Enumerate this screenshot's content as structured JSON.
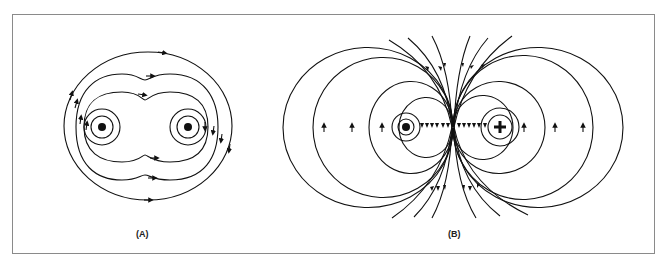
{
  "figure": {
    "panels": [
      {
        "id": "A",
        "label": "(A)",
        "description": "Magnetic field of two parallel conductors with current in the same direction (both out of page)",
        "conductors": [
          "dot",
          "dot"
        ]
      },
      {
        "id": "B",
        "label": "(B)",
        "description": "Magnetic field of two parallel conductors with current in opposite directions",
        "conductors": [
          "dot",
          "plus"
        ]
      }
    ],
    "colors": {
      "line": "#111111",
      "frame": "#8a8a8a"
    }
  }
}
